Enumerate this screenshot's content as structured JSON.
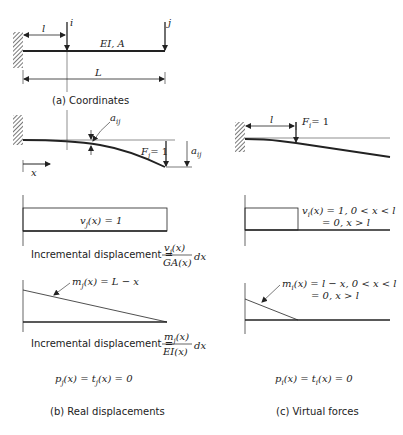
{
  "panel_a": {
    "caption": "(a) Coordinates",
    "dim_l": "l",
    "dim_L": "L",
    "point_i": "i",
    "point_j": "j",
    "beam_props": "EI, A"
  },
  "panel_b": {
    "deflection": {
      "a_ij": "a",
      "a_ij_sub": "ij",
      "a_jj": "a",
      "a_jj_sub": "ij",
      "force_label": "F",
      "force_sub": "j",
      "force_value": "= 1",
      "x_axis": "x"
    },
    "shear": {
      "label": "v",
      "sub": "j",
      "expr": "(x) = 1"
    },
    "shear_incr": {
      "prefix": "Incremental displacement  =",
      "numerator": "v",
      "numerator_sub": "j",
      "numerator_arg": "(x)",
      "denominator": "GA(x)",
      "suffix": "dx"
    },
    "moment": {
      "label": "m",
      "sub": "j",
      "expr": "(x) = L − x"
    },
    "moment_incr": {
      "prefix": "Incremental displacement  =",
      "numerator": "m",
      "numerator_sub": "j",
      "numerator_arg": "(x)",
      "denominator": "EI(x)",
      "suffix": "dx"
    },
    "loads": {
      "p": "p",
      "p_sub": "j",
      "expr_mid": "(x) = t",
      "t_sub": "j",
      "expr_end": "(x) = 0"
    },
    "caption": "(b) Real displacements"
  },
  "panel_c": {
    "deflection": {
      "dim_l": "l",
      "force_label": "F",
      "force_sub": "i",
      "force_value": "= 1"
    },
    "shear": {
      "label": "v",
      "sub": "i",
      "line1": "(x) = 1,  0 < x < l",
      "line2": "= 0,       x > l"
    },
    "moment": {
      "label": "m",
      "sub": "i",
      "line1": "(x) = l − x,  0 < x < l",
      "line2": "= 0,            x > l"
    },
    "loads": {
      "p": "p",
      "p_sub": "i",
      "expr_mid": "(x) = t",
      "t_sub": "i",
      "expr_end": "(x) = 0"
    },
    "caption": "(c) Virtual forces"
  },
  "colors": {
    "ink": "#222222",
    "hatch": "#555555",
    "background": "#ffffff"
  }
}
